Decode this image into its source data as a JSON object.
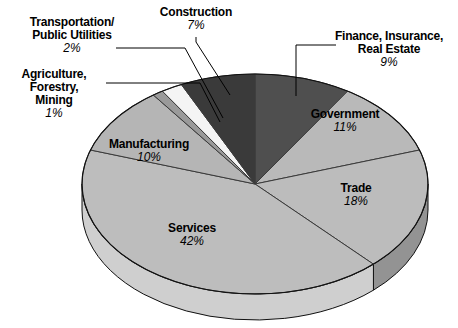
{
  "chart_data": {
    "type": "pie",
    "title": "",
    "subtitle": "",
    "xlabel": "",
    "ylabel": "",
    "legend_position": "none",
    "grid": false,
    "three_d": true,
    "start_angle_deg": 0,
    "direction": "clockwise",
    "units": "percent",
    "categories": [
      "Finance, Insurance, Real Estate",
      "Government",
      "Trade",
      "Services",
      "Manufacturing",
      "Agriculture, Forestry, Mining",
      "Transportation/Public Utilities",
      "Construction"
    ],
    "values": [
      9,
      11,
      18,
      42,
      10,
      1,
      2,
      7
    ],
    "colors": [
      "#4f4f4f",
      "#b9b9b9",
      "#bcbcbc",
      "#bdbdbd",
      "#b5b5b5",
      "#9a9a9a",
      "#f4f4f4",
      "#3a3a3a"
    ],
    "slices": [
      {
        "label": "Finance, Insurance, Real Estate",
        "label_lines": [
          "Finance, Insurance,",
          "Real Estate"
        ],
        "pct_text": "9%",
        "value": 9,
        "color": "#4f4f4f",
        "side_color": "#3b3b3b",
        "leader": true
      },
      {
        "label": "Government",
        "label_lines": [
          "Government"
        ],
        "pct_text": "11%",
        "value": 11,
        "color": "#b9b9b9",
        "side_color": "#8f8f8f",
        "leader": false
      },
      {
        "label": "Trade",
        "label_lines": [
          "Trade"
        ],
        "pct_text": "18%",
        "value": 18,
        "color": "#bcbcbc",
        "side_color": "#939393",
        "leader": false
      },
      {
        "label": "Services",
        "label_lines": [
          "Services"
        ],
        "pct_text": "42%",
        "value": 42,
        "color": "#bdbdbd",
        "side_color": "#cfcfcf",
        "leader": false
      },
      {
        "label": "Manufacturing",
        "label_lines": [
          "Manufacturing"
        ],
        "pct_text": "10%",
        "value": 10,
        "color": "#b5b5b5",
        "side_color": "#9c9c9c",
        "leader": false
      },
      {
        "label": "Agriculture, Forestry, Mining",
        "label_lines": [
          "Agriculture,",
          "Forestry,",
          "Mining"
        ],
        "pct_text": "1%",
        "value": 1,
        "color": "#9a9a9a",
        "side_color": "#8a8a8a",
        "leader": true
      },
      {
        "label": "Transportation/Public Utilities",
        "label_lines": [
          "Transportation/",
          "Public Utilities"
        ],
        "pct_text": "2%",
        "value": 2,
        "color": "#f4f4f4",
        "side_color": "#dcdcdc",
        "leader": true
      },
      {
        "label": "Construction",
        "label_lines": [
          "Construction"
        ],
        "pct_text": "7%",
        "value": 7,
        "color": "#3a3a3a",
        "side_color": "#2c2c2c",
        "leader": true
      }
    ]
  },
  "labels": {
    "transportation": {
      "line1": "Transportation/",
      "line2": "Public Utilities",
      "pct": "2%"
    },
    "agriculture": {
      "line1": "Agriculture,",
      "line2": "Forestry,",
      "line3": "Mining",
      "pct": "1%"
    },
    "construction": {
      "line1": "Construction",
      "pct": "7%"
    },
    "finance": {
      "line1": "Finance, Insurance,",
      "line2": "Real Estate",
      "pct": "9%"
    },
    "government": {
      "line1": "Government",
      "pct": "11%"
    },
    "trade": {
      "line1": "Trade",
      "pct": "18%"
    },
    "services": {
      "line1": "Services",
      "pct": "42%"
    },
    "manufacturing": {
      "line1": "Manufacturing",
      "pct": "10%"
    }
  }
}
